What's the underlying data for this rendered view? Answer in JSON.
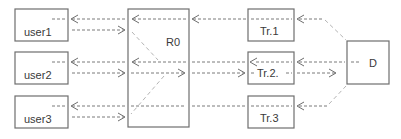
{
  "diagram": {
    "title": "",
    "nodes": [
      {
        "id": "user1",
        "label": "user1",
        "x": 15,
        "y": 9,
        "w": 53,
        "h": 32
      },
      {
        "id": "user2",
        "label": "user2",
        "x": 15,
        "y": 52,
        "w": 53,
        "h": 32
      },
      {
        "id": "user3",
        "label": "user3",
        "x": 15,
        "y": 96,
        "w": 53,
        "h": 32
      },
      {
        "id": "R0",
        "label": "R0",
        "x": 128,
        "y": 9,
        "w": 61,
        "h": 118
      },
      {
        "id": "Tr1",
        "label": "Tr.1",
        "x": 248,
        "y": 9,
        "w": 46,
        "h": 32
      },
      {
        "id": "Tr2",
        "label": "Tr.2.",
        "x": 248,
        "y": 52,
        "w": 46,
        "h": 32
      },
      {
        "id": "Tr3",
        "label": "Tr.3",
        "x": 248,
        "y": 96,
        "w": 46,
        "h": 32
      },
      {
        "id": "D",
        "label": "D",
        "x": 347,
        "y": 41,
        "w": 42,
        "h": 43
      }
    ],
    "edges": [
      {
        "from": "R0",
        "to": "user1",
        "style": "dashed"
      },
      {
        "from": "user1",
        "to": "R0",
        "style": "dashed"
      },
      {
        "from": "R0",
        "to": "user2",
        "style": "dashed"
      },
      {
        "from": "user2",
        "to": "R0",
        "style": "dashed"
      },
      {
        "from": "R0",
        "to": "user3",
        "style": "dashed"
      },
      {
        "from": "user3",
        "to": "R0",
        "style": "dashed"
      },
      {
        "from": "Tr1",
        "to": "R0",
        "style": "dashed"
      },
      {
        "from": "Tr2",
        "to": "R0",
        "style": "dashed"
      },
      {
        "from": "R0",
        "to": "Tr2",
        "style": "dashed"
      },
      {
        "from": "Tr3",
        "to": "R0",
        "style": "dashed"
      },
      {
        "from": "D",
        "to": "Tr1",
        "style": "dashed"
      },
      {
        "from": "D",
        "to": "Tr2",
        "style": "dashed"
      },
      {
        "from": "Tr2",
        "to": "D",
        "style": "dashed"
      },
      {
        "from": "D",
        "to": "Tr3",
        "style": "dashed"
      }
    ]
  },
  "labels": {
    "user1": "user1",
    "user2": "user2",
    "user3": "user3",
    "r0": "R0",
    "tr1": "Tr.1",
    "tr2": "Tr.2.",
    "tr3": "Tr.3",
    "d": "D"
  },
  "colors": {
    "box_stroke": "#6e6e6e",
    "line": "#7a7a7a",
    "diagonal": "#b5b5b5",
    "text": "#3a3a3a",
    "background": "#ffffff"
  }
}
